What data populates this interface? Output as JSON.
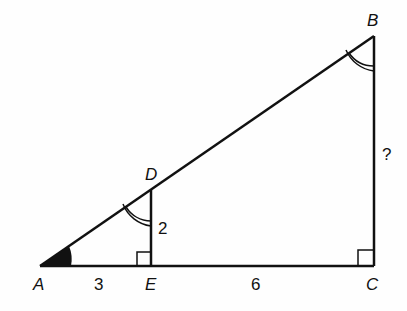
{
  "diagram": {
    "type": "similar-triangles",
    "points": {
      "A": "A",
      "B": "B",
      "C": "C",
      "D": "D",
      "E": "E"
    },
    "lengths": {
      "AE": "3",
      "EC": "6",
      "DE": "2",
      "BC": "?"
    },
    "colors": {
      "stroke": "#111111",
      "background": "#fefefe"
    }
  }
}
